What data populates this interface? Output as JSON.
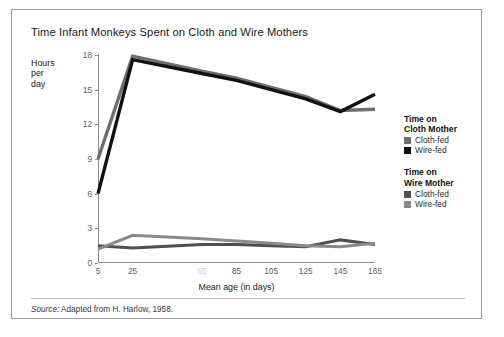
{
  "figure": {
    "title": "Time Infant Monkeys Spent on Cloth and Wire Mothers",
    "source_label": "Source:",
    "source_text": " Adapted from H. Harlow, 1958."
  },
  "legend": {
    "groups": [
      {
        "title_line1": "Time on",
        "title_line2": "Cloth Mother",
        "entries": [
          {
            "label": "Cloth-fed",
            "color": "#6e6e6e"
          },
          {
            "label": "Wire-fed",
            "color": "#111111"
          }
        ]
      },
      {
        "title_line1": "Time on",
        "title_line2": "Wire Mother",
        "entries": [
          {
            "label": "Cloth-fed",
            "color": "#4f4f4f"
          },
          {
            "label": "Wire-fed",
            "color": "#8a8a8a"
          }
        ]
      }
    ]
  },
  "chart_data": {
    "type": "line",
    "title": "Time Infant Monkeys Spent on Cloth and Wire Mothers",
    "xlabel": "Mean age (in days)",
    "ylabel": "Hours per day",
    "ylabel_lines": [
      "Hours",
      "per",
      "day"
    ],
    "xlim": [
      5,
      165
    ],
    "ylim": [
      0,
      18
    ],
    "grid": false,
    "legend_position": "right",
    "yticks": [
      0,
      3,
      6,
      9,
      12,
      15,
      18
    ],
    "ytick_labels": [
      "0",
      "3",
      "6",
      "9",
      "12",
      "15",
      "18"
    ],
    "xticks": [
      5,
      25,
      65,
      85,
      105,
      125,
      145,
      165
    ],
    "xtick_labels": [
      "5",
      "25",
      "65",
      "85",
      "105",
      "125",
      "145",
      "165"
    ],
    "xtick_faded": [
      false,
      false,
      true,
      false,
      false,
      false,
      false,
      false
    ],
    "x": [
      5,
      25,
      65,
      85,
      105,
      125,
      145,
      165
    ],
    "series": [
      {
        "name": "Time on Cloth Mother — Cloth-fed",
        "short_name": "Cloth-fed",
        "group": "Time on Cloth Mother",
        "color": "#6e6e6e",
        "width": 3.4,
        "values": [
          9.0,
          17.9,
          16.6,
          16.0,
          15.2,
          14.4,
          13.2,
          13.3
        ]
      },
      {
        "name": "Time on Cloth Mother — Wire-fed",
        "short_name": "Wire-fed",
        "group": "Time on Cloth Mother",
        "color": "#111111",
        "width": 3.4,
        "values": [
          6.0,
          17.6,
          16.4,
          15.8,
          15.0,
          14.2,
          13.1,
          14.6
        ]
      },
      {
        "name": "Time on Wire Mother — Cloth-fed",
        "short_name": "Cloth-fed",
        "group": "Time on Wire Mother",
        "color": "#4f4f4f",
        "width": 3.0,
        "values": [
          1.5,
          1.3,
          1.6,
          1.6,
          1.5,
          1.4,
          2.0,
          1.6
        ]
      },
      {
        "name": "Time on Wire Mother — Wire-fed",
        "short_name": "Wire-fed",
        "group": "Time on Wire Mother",
        "color": "#8a8a8a",
        "width": 3.0,
        "values": [
          1.2,
          2.4,
          2.1,
          1.9,
          1.7,
          1.5,
          1.4,
          1.7
        ]
      }
    ]
  }
}
